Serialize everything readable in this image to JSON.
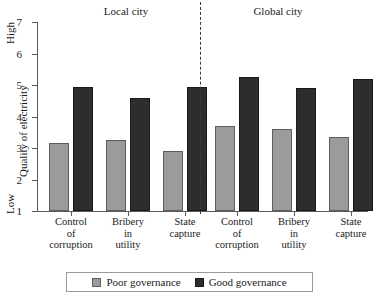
{
  "chart_data": {
    "type": "bar",
    "title": "",
    "xlabel": "",
    "ylabel": "Quality of electricity",
    "ylim": [
      1,
      7
    ],
    "yticks": [
      "1",
      "2",
      "3",
      "4",
      "5",
      "6",
      "7"
    ],
    "grid": false,
    "legend_position": "bottom",
    "axis_high_label": "High",
    "axis_low_label": "Low",
    "panels": [
      {
        "name": "Local city",
        "categories": [
          "Control of corruption",
          "Bribery in utility",
          "State capture"
        ],
        "series": [
          {
            "name": "Poor governance",
            "values": [
              3.15,
              3.25,
              2.9
            ]
          },
          {
            "name": "Good governance",
            "values": [
              4.95,
              4.6,
              4.95
            ]
          }
        ]
      },
      {
        "name": "Global city",
        "categories": [
          "Control of corruption",
          "Bribery in utility",
          "State capture"
        ],
        "series": [
          {
            "name": "Poor governance",
            "values": [
              3.7,
              3.6,
              3.35
            ]
          },
          {
            "name": "Good governance",
            "values": [
              5.25,
              4.9,
              5.2
            ]
          }
        ]
      }
    ],
    "series_colors": {
      "Poor governance": "#9b9b9b",
      "Good governance": "#2d2d2d"
    }
  },
  "panel_titles": {
    "local": "Local city",
    "global": "Global city"
  },
  "y_axis": {
    "label": "Quality of electricity",
    "high": "High",
    "low": "Low",
    "ticks": [
      "7",
      "6",
      "5",
      "4",
      "3",
      "2",
      "1"
    ]
  },
  "x_labels": {
    "control_l1": "Control",
    "control_l2": "of",
    "control_l3": "corruption",
    "bribery_l1": "Bribery",
    "bribery_l2": "in",
    "bribery_l3": "utility",
    "capture_l1": "State",
    "capture_l2": "capture"
  },
  "legend": {
    "poor": "Poor governance",
    "good": "Good governance"
  }
}
